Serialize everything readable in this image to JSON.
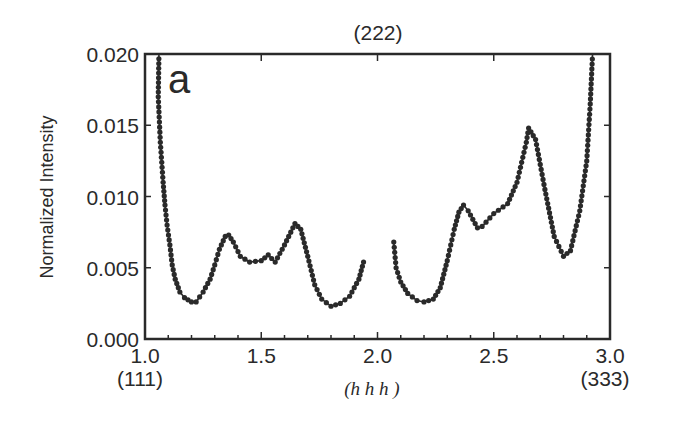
{
  "chart_data": {
    "type": "line",
    "title": "",
    "panel_label": "a",
    "top_annotation": "(222)",
    "xlabel": "(h h h )",
    "ylabel": "Normalized Intensity",
    "xlim": [
      1.0,
      3.0
    ],
    "ylim": [
      0.0,
      0.02
    ],
    "x_ticks": [
      "1.0",
      "1.5",
      "2.0",
      "2.5",
      "3.0"
    ],
    "x_tick_values": [
      1.0,
      1.5,
      2.0,
      2.5,
      3.0
    ],
    "x_sub_labels": [
      {
        "x": 1.0,
        "label": "(111)"
      },
      {
        "x": 3.0,
        "label": "(333)"
      }
    ],
    "y_ticks": [
      "0.000",
      "0.005",
      "0.010",
      "0.015",
      "0.020"
    ],
    "y_tick_values": [
      0.0,
      0.005,
      0.01,
      0.015,
      0.02
    ],
    "grid": false,
    "legend": null,
    "series": [
      {
        "name": "branch-1",
        "x": [
          1.06,
          1.057,
          1.066,
          1.078,
          1.086,
          1.095,
          1.107,
          1.117,
          1.13,
          1.15,
          1.17,
          1.2,
          1.22,
          1.25,
          1.28,
          1.3,
          1.32,
          1.345,
          1.36,
          1.38,
          1.41,
          1.45,
          1.5,
          1.53,
          1.56,
          1.6,
          1.645,
          1.67,
          1.7,
          1.73,
          1.76,
          1.8,
          1.84,
          1.88,
          1.92,
          1.94
        ],
        "values": [
          0.02,
          0.017,
          0.0138,
          0.011,
          0.0094,
          0.008,
          0.0066,
          0.0052,
          0.0042,
          0.0033,
          0.0029,
          0.0026,
          0.0026,
          0.0033,
          0.0042,
          0.0052,
          0.0063,
          0.0072,
          0.0073,
          0.0068,
          0.0058,
          0.0054,
          0.0055,
          0.0059,
          0.0054,
          0.0066,
          0.0081,
          0.0077,
          0.0058,
          0.0038,
          0.0028,
          0.0023,
          0.0025,
          0.003,
          0.0042,
          0.0054
        ]
      },
      {
        "name": "branch-2",
        "x": [
          2.07,
          2.08,
          2.1,
          2.13,
          2.17,
          2.2,
          2.24,
          2.27,
          2.3,
          2.33,
          2.35,
          2.37,
          2.39,
          2.43,
          2.45,
          2.5,
          2.56,
          2.6,
          2.64,
          2.65,
          2.68,
          2.72,
          2.76,
          2.8,
          2.83,
          2.87,
          2.9,
          2.915,
          2.925
        ],
        "values": [
          0.0068,
          0.005,
          0.004,
          0.0032,
          0.0027,
          0.0026,
          0.0028,
          0.0036,
          0.0055,
          0.0077,
          0.0089,
          0.0094,
          0.009,
          0.0078,
          0.0079,
          0.0088,
          0.0095,
          0.011,
          0.0138,
          0.0148,
          0.014,
          0.0105,
          0.0072,
          0.0058,
          0.0062,
          0.009,
          0.0125,
          0.0165,
          0.02
        ]
      }
    ],
    "colors": {
      "line": "#2a2a2a",
      "marker": "#2a2a2a",
      "axes": "#2a2a2a"
    }
  }
}
